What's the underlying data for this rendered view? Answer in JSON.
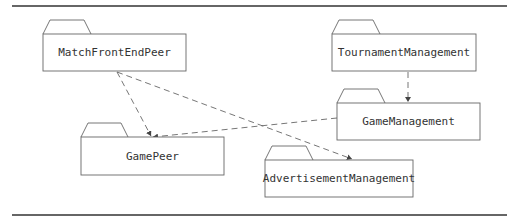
{
  "diagram": {
    "type": "uml-package-diagram",
    "packages": [
      {
        "id": "match_front_end_peer",
        "label": "MatchFrontEndPeer",
        "x": 43,
        "y": 34,
        "w": 143,
        "h": 37
      },
      {
        "id": "tournament_management",
        "label": "TournamentManagement",
        "x": 332,
        "y": 34,
        "w": 144,
        "h": 37
      },
      {
        "id": "game_management",
        "label": "GameManagement",
        "x": 337,
        "y": 103,
        "w": 143,
        "h": 37
      },
      {
        "id": "game_peer",
        "label": "GamePeer",
        "x": 81,
        "y": 137,
        "w": 143,
        "h": 38
      },
      {
        "id": "advertisement_management",
        "label": "AdvertisementManagement",
        "x": 265,
        "y": 160,
        "w": 148,
        "h": 37
      }
    ],
    "dependencies": [
      {
        "from": "MatchFrontEndPeer",
        "to": "GamePeer"
      },
      {
        "from": "MatchFrontEndPeer",
        "to": "AdvertisementManagement"
      },
      {
        "from": "TournamentManagement",
        "to": "GameManagement"
      },
      {
        "from": "GameManagement",
        "to": "GamePeer"
      }
    ],
    "colors": {
      "line": "#555555",
      "rule": "#333333",
      "text": "#333333",
      "background": "#ffffff"
    }
  }
}
